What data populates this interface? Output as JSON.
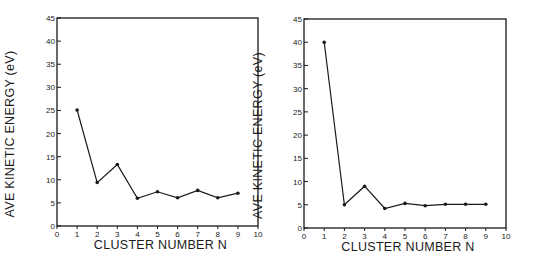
{
  "chart_data": [
    {
      "type": "line",
      "title": "",
      "xlabel": "CLUSTER NUMBER  N",
      "ylabel": "AVE  KINETIC  ENERGY  (eV)",
      "xlim": [
        0,
        10
      ],
      "ylim": [
        0,
        45
      ],
      "xticks": [
        "0",
        "1",
        "2",
        "3",
        "4",
        "5",
        "6",
        "7",
        "8",
        "9",
        "10"
      ],
      "yticks": [
        "0",
        "5",
        "10",
        "15",
        "20",
        "25",
        "30",
        "35",
        "40",
        "45"
      ],
      "grid": false,
      "legend": null,
      "series": [
        {
          "name": "left",
          "x": [
            1,
            2,
            3,
            4,
            5,
            6,
            7,
            8,
            9
          ],
          "values": [
            25.1,
            9.4,
            13.3,
            6.0,
            7.4,
            6.1,
            7.7,
            6.1,
            7.1
          ]
        }
      ]
    },
    {
      "type": "line",
      "title": "",
      "xlabel": "CLUSTER NUMBER  N",
      "ylabel": "AVE  KINETIC  ENERGY  (eV)",
      "xlim": [
        0,
        10
      ],
      "ylim": [
        0,
        45
      ],
      "xticks": [
        "0",
        "1",
        "2",
        "3",
        "4",
        "5",
        "6",
        "7",
        "8",
        "9",
        "10"
      ],
      "yticks": [
        "0",
        "5",
        "10",
        "15",
        "20",
        "25",
        "30",
        "35",
        "40",
        "45"
      ],
      "grid": false,
      "legend": null,
      "series": [
        {
          "name": "right",
          "x": [
            1,
            2,
            3,
            4,
            5,
            6,
            7,
            8,
            9
          ],
          "values": [
            40.0,
            5.0,
            9.0,
            4.2,
            5.3,
            4.8,
            5.1,
            5.1,
            5.1
          ]
        }
      ]
    }
  ],
  "layout": [
    {
      "x0": 57,
      "x1": 258,
      "y0": 226,
      "y1": 18,
      "ylabel_x": 14
    },
    {
      "x0": 304,
      "x1": 506,
      "y0": 228,
      "y1": 19,
      "ylabel_x": 262
    }
  ],
  "colors": {
    "ink": "#1a1a1a",
    "background": "#ffffff"
  }
}
